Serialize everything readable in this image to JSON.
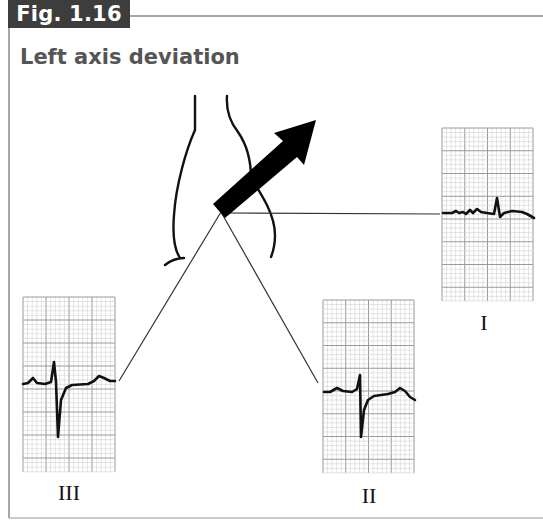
{
  "figure": {
    "tab_label": "Fig. 1.16",
    "title": "Left axis deviation"
  },
  "diagram": {
    "axis_arrow": {
      "direction": "upward-left (left axis deviation)",
      "color": "#000000"
    },
    "leads": [
      {
        "id": "I",
        "label": "I",
        "qrs": "small positive R deflection"
      },
      {
        "id": "II",
        "label": "II",
        "qrs": "predominantly negative (deep S)"
      },
      {
        "id": "III",
        "label": "III",
        "qrs": "predominantly negative (deep S)"
      }
    ],
    "colors": {
      "tab_background": "#3d3d3d",
      "title_text": "#555555",
      "grid_minor": "#c8c8c8",
      "grid_major": "#9a9a9a",
      "trace": "#111111"
    }
  }
}
